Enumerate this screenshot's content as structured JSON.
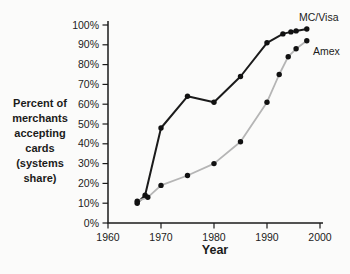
{
  "page": {
    "background": "#fbfbfa",
    "text_color": "#1b1b1b"
  },
  "chart_data": {
    "type": "line",
    "title": "",
    "xlabel": "Year",
    "ylabel": "Percent of merchants accepting cards (systems share)",
    "ylabel_lines": [
      "Percent of",
      "merchants",
      "accepting",
      "cards",
      "(systems",
      "share)"
    ],
    "xlim": [
      1960,
      2000
    ],
    "ylim": [
      0,
      100
    ],
    "grid": false,
    "x_tick_labels": [
      "1960",
      "1970",
      "1980",
      "1990",
      "2000"
    ],
    "y_tick_labels": [
      "0%",
      "10%",
      "20%",
      "30%",
      "40%",
      "50%",
      "60%",
      "70%",
      "80%",
      "90%",
      "100%"
    ],
    "axis_color": "#1b1b1b",
    "marker_color": "#111111",
    "legend_position": "end-of-line labels, top right",
    "series": [
      {
        "name": "MC/Visa",
        "color": "#1b1b1b",
        "line_width": 2,
        "points": [
          [
            1965.5,
            10
          ],
          [
            1967,
            14
          ],
          [
            1970,
            48
          ],
          [
            1975,
            64
          ],
          [
            1980,
            61
          ],
          [
            1985,
            74
          ],
          [
            1990,
            91
          ],
          [
            1993,
            95.5
          ],
          [
            1994.5,
            96.5
          ],
          [
            1995.5,
            97
          ],
          [
            1997.5,
            98
          ]
        ]
      },
      {
        "name": "Amex",
        "color": "#b5b5b5",
        "line_width": 1.8,
        "points": [
          [
            1965.5,
            11
          ],
          [
            1967.5,
            13
          ],
          [
            1970,
            19
          ],
          [
            1975,
            24
          ],
          [
            1980,
            30
          ],
          [
            1985,
            41
          ],
          [
            1990,
            61
          ],
          [
            1992.3,
            75
          ],
          [
            1994,
            84
          ],
          [
            1995.5,
            88
          ],
          [
            1997.5,
            92
          ]
        ]
      }
    ]
  }
}
